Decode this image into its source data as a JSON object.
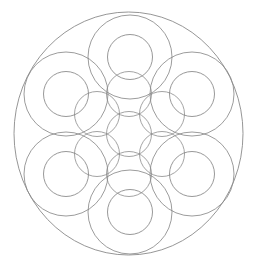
{
  "artwork": {
    "title": "Overlapping Circles Mandala",
    "type": "geometric-line-drawing",
    "canvas": {
      "width": 258,
      "height": 268
    },
    "background_color": "#ffffff",
    "stroke_color": "#7b7b7b",
    "stroke_color_light": "#9a9a9a",
    "stroke_width": 0.8,
    "symmetry": "6-fold radial",
    "center": {
      "x": 129,
      "y": 134
    }
  },
  "shapes": {
    "boundary": {
      "name": "outer-boundary-circle",
      "cx": 128.5,
      "cy": 133.5,
      "rx": 114.5,
      "ry": 121.5,
      "stroke": "#8a8a8a",
      "stroke_width": 0.9
    },
    "petal_rings": [
      {
        "label": "ring-top",
        "cx": 130,
        "cy": 57,
        "r_outer": 42,
        "r_inner": 22.5
      },
      {
        "label": "ring-upper-right",
        "cx": 192,
        "cy": 94,
        "r_outer": 42,
        "r_inner": 22.5
      },
      {
        "label": "ring-lower-right",
        "cx": 192,
        "cy": 174,
        "r_outer": 42,
        "r_inner": 22.5
      },
      {
        "label": "ring-bottom",
        "cx": 130,
        "cy": 212,
        "r_outer": 42,
        "r_inner": 22.5
      },
      {
        "label": "ring-lower-left",
        "cx": 66,
        "cy": 174,
        "r_outer": 42,
        "r_inner": 22.5
      },
      {
        "label": "ring-upper-left",
        "cx": 66,
        "cy": 94,
        "r_outer": 42,
        "r_inner": 22.5
      }
    ],
    "inner_circles": [
      {
        "label": "core-center",
        "cx": 129,
        "cy": 134,
        "r": 22.5
      },
      {
        "label": "core-top",
        "cx": 129,
        "cy": 94,
        "r": 22.5
      },
      {
        "label": "core-upper-right",
        "cx": 162,
        "cy": 114,
        "r": 22.5
      },
      {
        "label": "core-lower-right",
        "cx": 162,
        "cy": 154,
        "r": 22.5
      },
      {
        "label": "core-bottom",
        "cx": 129,
        "cy": 174,
        "r": 22.5
      },
      {
        "label": "core-lower-left",
        "cx": 97,
        "cy": 154,
        "r": 22.5
      },
      {
        "label": "core-upper-left",
        "cx": 97,
        "cy": 114,
        "r": 22.5
      }
    ],
    "stroke_color_outer_ring": "#838383",
    "stroke_color_inner_ring": "#7d7d7d",
    "stroke_color_core": "#8c8c8c"
  }
}
